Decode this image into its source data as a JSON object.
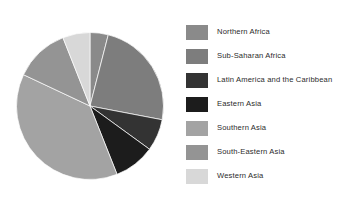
{
  "chart_data": {
    "type": "pie",
    "title": "",
    "subtitle": "",
    "xlabel": "",
    "ylabel": "",
    "grid": false,
    "legend_position": "right",
    "start_angle_deg": 0,
    "direction": "clockwise",
    "categories": [
      "Northern Africa",
      "Sub-Saharan Africa",
      "Latin America and the Caribbean",
      "Eastern Asia",
      "Southern Asia",
      "South-Eastern Asia",
      "Western Asia"
    ],
    "values": [
      4,
      24,
      7,
      9,
      38,
      12,
      6
    ],
    "colors": [
      "#8a8a8a",
      "#7d7d7d",
      "#333333",
      "#1c1c1c",
      "#a3a3a3",
      "#949494",
      "#d8d8d8"
    ],
    "slices": [
      {
        "label": "Northern Africa",
        "value": 4,
        "color": "#8a8a8a",
        "start_deg": 0,
        "end_deg": 14.4
      },
      {
        "label": "Sub-Saharan Africa",
        "value": 24,
        "color": "#7d7d7d",
        "start_deg": 14.4,
        "end_deg": 100.8
      },
      {
        "label": "Latin America and the Caribbean",
        "value": 7,
        "color": "#333333",
        "start_deg": 100.8,
        "end_deg": 126.0
      },
      {
        "label": "Eastern Asia",
        "value": 9,
        "color": "#1c1c1c",
        "start_deg": 126.0,
        "end_deg": 158.4
      },
      {
        "label": "Southern Asia",
        "value": 38,
        "color": "#a3a3a3",
        "start_deg": 158.4,
        "end_deg": 295.2
      },
      {
        "label": "South-Eastern Asia",
        "value": 12,
        "color": "#949494",
        "start_deg": 295.2,
        "end_deg": 338.4
      },
      {
        "label": "Western Asia",
        "value": 6,
        "color": "#d8d8d8",
        "start_deg": 338.4,
        "end_deg": 360.0
      }
    ]
  },
  "legend": {
    "items": [
      {
        "label": "Northern Africa",
        "color": "#8a8a8a"
      },
      {
        "label": "Sub-Saharan Africa",
        "color": "#7d7d7d"
      },
      {
        "label": "Latin America and the Caribbean",
        "color": "#333333"
      },
      {
        "label": "Eastern Asia",
        "color": "#1c1c1c"
      },
      {
        "label": "Southern Asia",
        "color": "#a3a3a3"
      },
      {
        "label": "South-Eastern Asia",
        "color": "#949494"
      },
      {
        "label": "Western Asia",
        "color": "#d8d8d8"
      }
    ]
  },
  "canvas": {
    "background": "#ffffff"
  }
}
